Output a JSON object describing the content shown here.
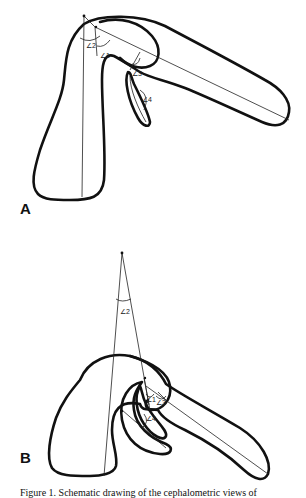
{
  "figure": {
    "panels": [
      {
        "label": "A",
        "angles": [
          "∠1",
          "∠2",
          "∠3",
          "∠4"
        ]
      },
      {
        "label": "B",
        "angles": [
          "∠1",
          "∠2",
          "∠3",
          "∠4"
        ]
      }
    ],
    "caption": "Figure 1. Schematic drawing of the cephalometric views of"
  }
}
